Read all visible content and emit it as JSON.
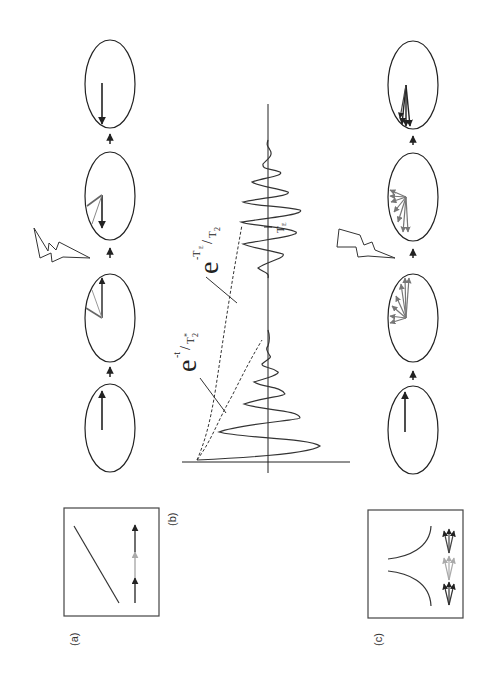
{
  "figure": {
    "panel_labels": {
      "a": "(a)",
      "b": "(b)",
      "c": "(c)"
    },
    "formulas": {
      "t2star_base": "e",
      "t2star_exp_num": "-t",
      "t2star_exp_den": "T",
      "t2star_exp_den_sub": "2",
      "t2star_exp_den_sup": "*",
      "t2_base": "e",
      "t2_exp_num": "-T",
      "t2_exp_num_sub": "E",
      "t2_exp_den": "T",
      "t2_exp_den_sub": "2"
    },
    "echo_time_label": "T",
    "echo_time_sub": "E",
    "colors": {
      "line": "#222222",
      "gray_vector": "#7a7a7a",
      "light_vector": "#a8a8a8"
    }
  }
}
